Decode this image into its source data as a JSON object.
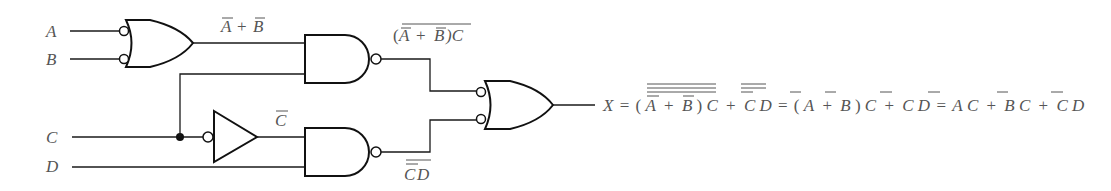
{
  "diagram": {
    "type": "logic-circuit",
    "inputs": [
      {
        "name": "A",
        "label": "A"
      },
      {
        "name": "B",
        "label": "B"
      },
      {
        "name": "C",
        "label": "C"
      },
      {
        "name": "D",
        "label": "D"
      }
    ],
    "gates": [
      {
        "id": "g1",
        "kind": "OR with inverted inputs (negative-AND)",
        "inputs": [
          "A",
          "B"
        ],
        "output_label": "A̅ + B̅"
      },
      {
        "id": "g2",
        "kind": "NAND",
        "inputs": [
          "g1",
          "C"
        ],
        "output_label": "(A̅ + B̅)C, overbarred"
      },
      {
        "id": "inv",
        "kind": "inverter (bubble on input)",
        "inputs": [
          "C"
        ],
        "output_label": "C̅"
      },
      {
        "id": "g3",
        "kind": "NAND",
        "inputs": [
          "inv",
          "D"
        ],
        "output_label": "C̅D, overbarred"
      },
      {
        "id": "g4",
        "kind": "OR with inverted inputs (negative-AND)",
        "inputs": [
          "g2",
          "g3"
        ],
        "output_label": "X"
      }
    ],
    "labels": {
      "input_a": "A",
      "input_b": "B",
      "input_c": "C",
      "input_d": "D",
      "g1_out_a": "A",
      "plus": "+",
      "g1_out_b": "B",
      "g2_open": "(",
      "g2_a": "A",
      "g2_plus": "+",
      "g2_b": "B",
      "g2_close_c": ")C",
      "inv_out": "C",
      "g3_c": "C",
      "g3_d": "D"
    },
    "output_expression": {
      "full_text": "X = (A̅ + B̅)C (double overbar) + C̅D (double overbar) = (A̅ + B̅)C + C̅D = A̅C + B̅C + C̅D",
      "x": "X",
      "eq": "=",
      "open": "(",
      "a": "A",
      "plus": "+",
      "b": "B",
      "close": ")",
      "c": "C",
      "d": "D"
    },
    "colors": {
      "lines": "#111111",
      "text": "#555555",
      "background": "#ffffff"
    }
  }
}
